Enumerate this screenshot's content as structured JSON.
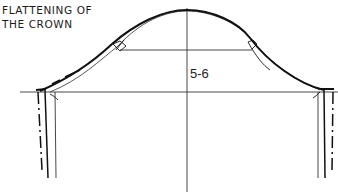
{
  "title": {
    "line1": "FLATTENING OF",
    "line2": "THE CROWN"
  },
  "labels": {
    "measurement": "5-6"
  },
  "colors": {
    "ink": "#111111",
    "thin_line": "#333333",
    "background": "#ffffff"
  }
}
